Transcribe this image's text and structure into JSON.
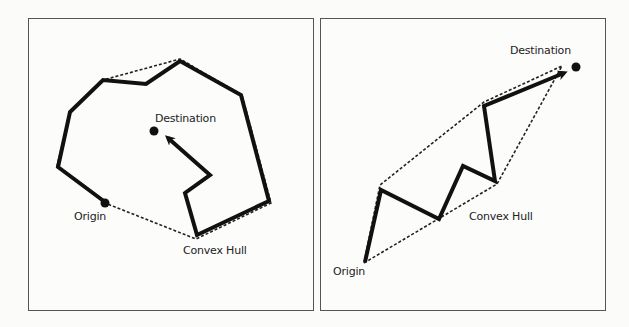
{
  "figure": {
    "panels": [
      {
        "id": "left",
        "labels": {
          "origin": "Origin",
          "destination": "Destination",
          "hull": "Convex Hull"
        }
      },
      {
        "id": "right",
        "labels": {
          "origin": "Origin",
          "destination": "Destination",
          "hull": "Convex Hull"
        }
      }
    ]
  },
  "colors": {
    "path": "#111111",
    "hull": "#222222",
    "frame": "#555555"
  }
}
